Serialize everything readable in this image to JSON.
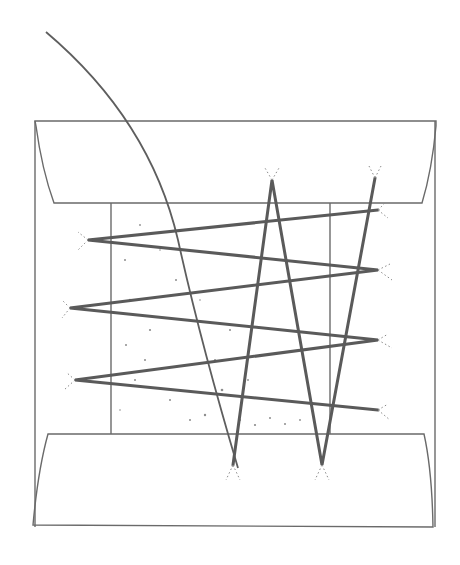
{
  "diagram": {
    "colors": {
      "background": "#ffffff",
      "line": "#6a6a6a",
      "thread": "#5a5a5a",
      "shading": "#8d8d8d"
    },
    "horizontal_zigzag_points": [
      [
        378,
        210
      ],
      [
        88,
        240
      ],
      [
        378,
        270
      ],
      [
        70,
        308
      ],
      [
        378,
        340
      ],
      [
        75,
        380
      ],
      [
        378,
        410
      ]
    ],
    "vertical_zigzag_points": [
      [
        233,
        465
      ],
      [
        272,
        180
      ],
      [
        322,
        465
      ],
      [
        375,
        178
      ]
    ],
    "long_arc": {
      "start": [
        46,
        32
      ],
      "end": [
        238,
        468
      ]
    }
  }
}
